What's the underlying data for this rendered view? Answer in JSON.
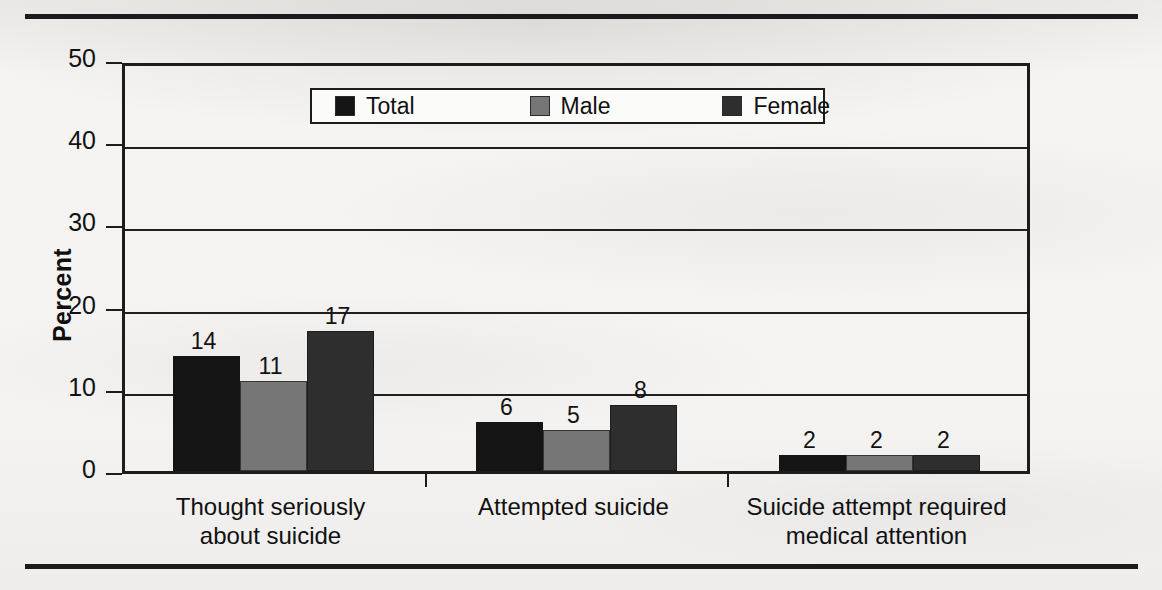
{
  "figure": {
    "ylabel": "Percent",
    "legend": {
      "position": "top-center-inside",
      "items": [
        {
          "label": "Total",
          "color": "#141414"
        },
        {
          "label": "Male",
          "color": "#767676"
        },
        {
          "label": "Female",
          "color": "#2e2e2e"
        }
      ]
    }
  },
  "chart_data": {
    "type": "bar",
    "title": "",
    "subtitle": "",
    "xlabel": "",
    "ylabel": "Percent",
    "ylim": [
      0,
      50
    ],
    "yticks": [
      0,
      10,
      20,
      30,
      40,
      50
    ],
    "ytick_labels": [
      "0",
      "10",
      "20",
      "30",
      "40",
      "50"
    ],
    "grid": true,
    "grid_axis": "y",
    "legend_position": "upper center",
    "categories": [
      "Thought seriously\nabout suicide",
      "Attempted suicide",
      "Suicide attempt required\nmedical attention"
    ],
    "series": [
      {
        "name": "Total",
        "color": "#141414",
        "values": [
          14,
          6,
          2
        ],
        "labels": [
          "14",
          "6",
          "2"
        ]
      },
      {
        "name": "Male",
        "color": "#767676",
        "values": [
          11,
          5,
          2
        ],
        "labels": [
          "11",
          "5",
          "2"
        ]
      },
      {
        "name": "Female",
        "color": "#2e2e2e",
        "values": [
          17,
          8,
          2
        ],
        "labels": [
          "17",
          "8",
          "2"
        ]
      }
    ],
    "bar_value_labels_shown": true,
    "annotations": []
  }
}
